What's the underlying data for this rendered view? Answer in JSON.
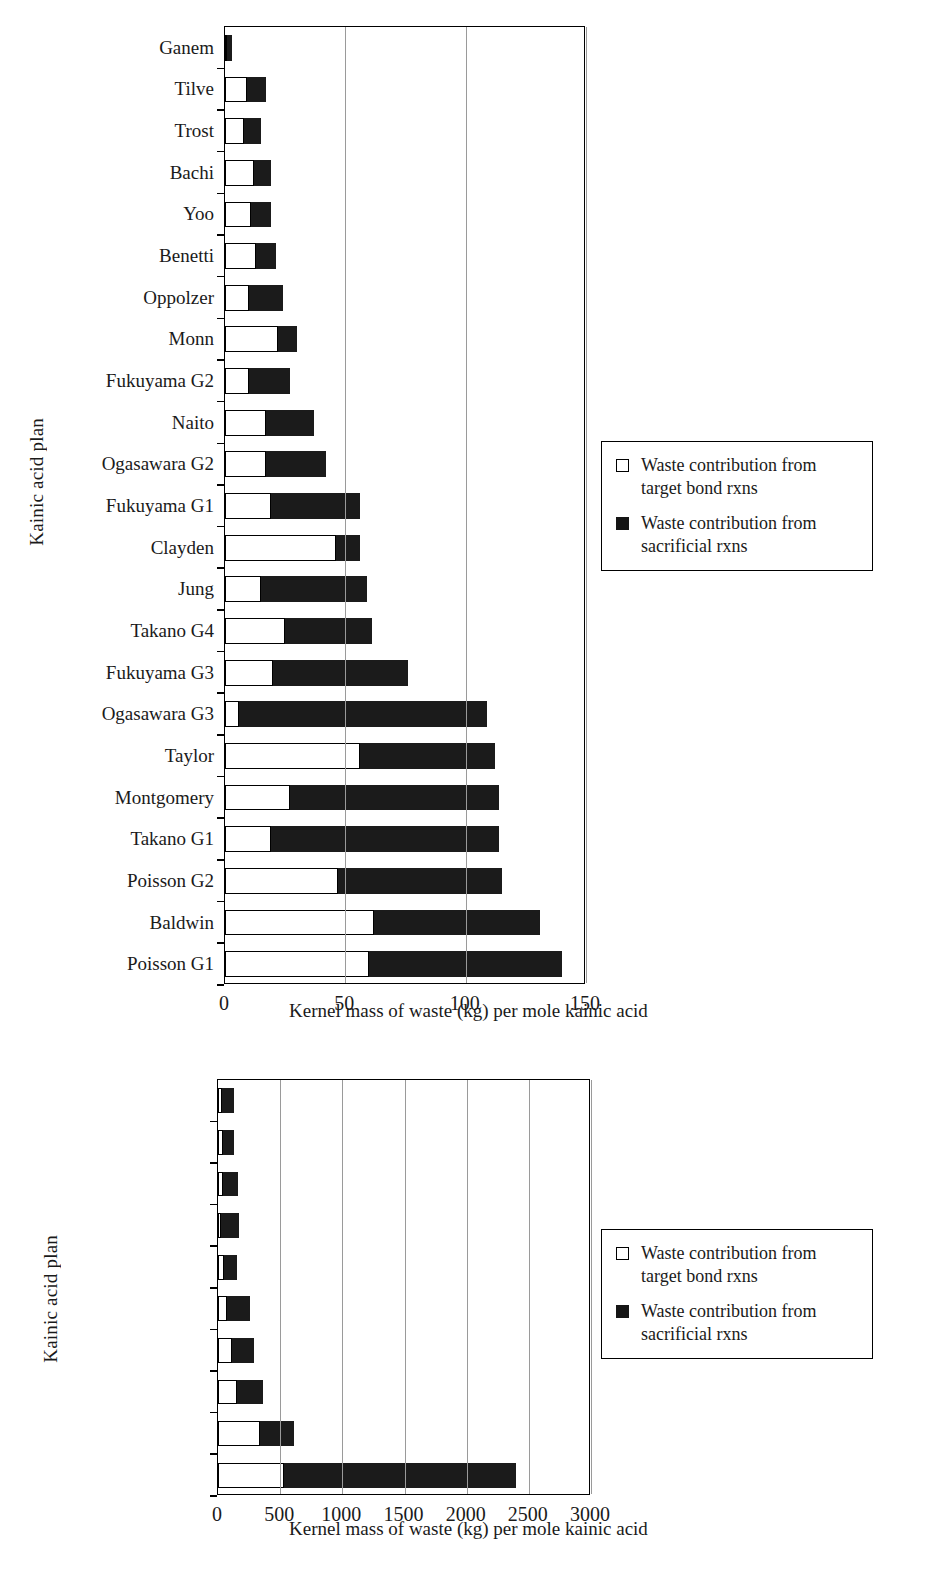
{
  "figure": {
    "title": "",
    "axis_title": "Kernel mass of waste (kg) per mole kainic acid",
    "y_axis_label": "Kainic acid plan",
    "colors": {
      "target_bond": "#ffffff",
      "sacrificial": "#1b1b1b",
      "axis": "#000000",
      "gridline": "#9a9a9a"
    },
    "legend": {
      "target_label": "Waste contribution from target bond rxns",
      "sacrificial_label": "Waste contribution from sacrificial rxns",
      "target_label_line1": "Waste contribution from",
      "target_label_line2": "target bond rxns",
      "sacrificial_label_line1": "Waste contribution from",
      "sacrificial_label_line2": "sacrificial rxns",
      "position": "right-middle"
    }
  },
  "chart_data": [
    {
      "id": "top",
      "type": "bar",
      "orientation": "horizontal",
      "stacked": true,
      "title": "",
      "xlabel": "Kernel mass of waste (kg) per mole kainic acid",
      "ylabel": "Kainic acid plan",
      "xlim": [
        0,
        150
      ],
      "xticks": [
        0,
        50,
        100,
        150
      ],
      "xtick_labels": [
        "0",
        "50",
        "100",
        "150"
      ],
      "grid": true,
      "legend": [
        "Waste contribution from target bond rxns",
        "Waste contribution from sacrificial rxns"
      ],
      "categories": [
        "Ganem",
        "Tilve",
        "Trost",
        "Bachi",
        "Yoo",
        "Benetti",
        "Oppolzer",
        "Monn",
        "Fukuyama G2",
        "Naito",
        "Ogasawara G2",
        "Fukuyama G1",
        "Clayden",
        "Jung",
        "Takano G4",
        "Fukuyama G3",
        "Ogasawara G3",
        "Taylor",
        "Montgomery",
        "Takano G1",
        "Poisson G2",
        "Baldwin",
        "Poisson G1"
      ],
      "series": [
        {
          "name": "Waste contribution from target bond rxns",
          "values": [
            1,
            9,
            8,
            12,
            11,
            13,
            10,
            22,
            10,
            17,
            17,
            19,
            46,
            15,
            25,
            20,
            6,
            56,
            27,
            19,
            47,
            62,
            60
          ]
        },
        {
          "name": "Waste contribution from sacrificial rxns",
          "values": [
            2,
            8,
            7,
            7,
            8,
            8,
            14,
            8,
            17,
            20,
            25,
            37,
            10,
            44,
            36,
            56,
            103,
            56,
            87,
            95,
            68,
            69,
            80
          ]
        }
      ],
      "totals": [
        3,
        17,
        15,
        19,
        19,
        21,
        24,
        30,
        27,
        37,
        42,
        56,
        56,
        59,
        61,
        76,
        109,
        112,
        114,
        114,
        115,
        131,
        140
      ]
    },
    {
      "id": "bottom",
      "type": "bar",
      "orientation": "horizontal",
      "stacked": true,
      "title": "",
      "xlabel": "Kernel mass of waste (kg) per mole kainic acid",
      "ylabel": "Kainic acid plan",
      "xlim": [
        0,
        3000
      ],
      "xticks": [
        0,
        500,
        1000,
        1500,
        2000,
        2500,
        3000
      ],
      "xtick_labels": [
        "0",
        "500",
        "1000",
        "1500",
        "2000",
        "2500",
        "3000"
      ],
      "grid": true,
      "legend": [
        "Waste contribution from target bond rxns",
        "Waste contribution from sacrificial rxns"
      ],
      "categories": [
        "Hanessian",
        "Knight",
        "Lautens",
        "Anderson",
        "Rubio",
        "Takano G2",
        "Hoppe",
        "Ogasawara G1",
        "Takano G3",
        "Cossy"
      ],
      "series": [
        {
          "name": "Waste contribution from target bond rxns",
          "values": [
            30,
            40,
            40,
            25,
            45,
            70,
            110,
            150,
            340,
            530
          ]
        },
        {
          "name": "Waste contribution from sacrificial rxns",
          "values": [
            100,
            85,
            120,
            145,
            110,
            185,
            180,
            215,
            270,
            1870
          ]
        }
      ],
      "totals": [
        130,
        125,
        160,
        170,
        155,
        255,
        290,
        365,
        610,
        2400
      ]
    }
  ]
}
